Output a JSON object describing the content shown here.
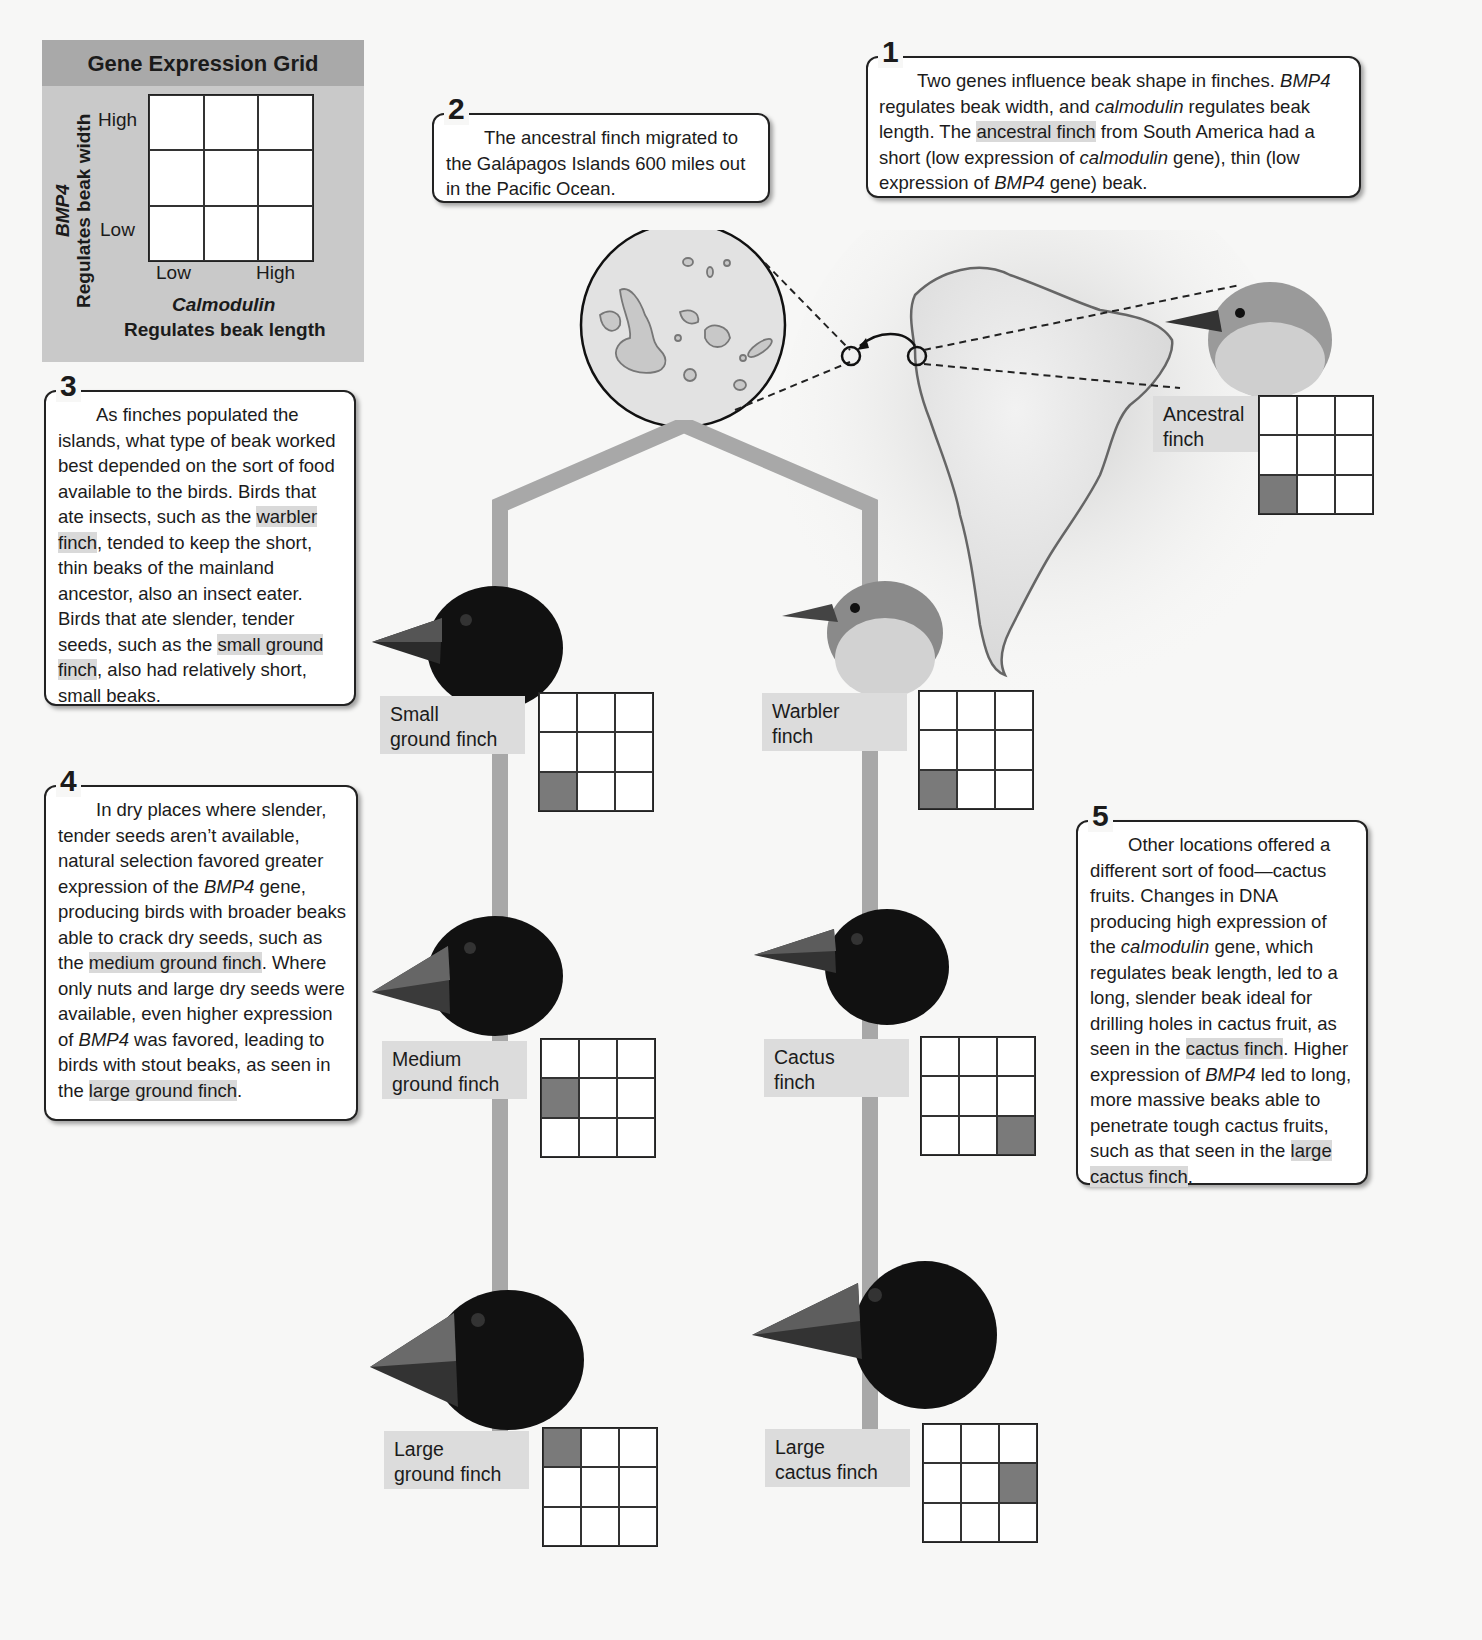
{
  "legend": {
    "title": "Gene Expression Grid",
    "y_gene": "BMP4",
    "y_desc": "Regulates beak width",
    "y_high": "High",
    "y_low": "Low",
    "x_low": "Low",
    "x_high": "High",
    "x_gene": "Calmodulin",
    "x_desc": "Regulates beak length"
  },
  "callouts": [
    {
      "num": "1",
      "segments": [
        {
          "t": "Two genes influence beak shape in finches. "
        },
        {
          "t": "BMP4",
          "i": true
        },
        {
          "t": " regulates beak width, and "
        },
        {
          "t": "calmodulin",
          "i": true
        },
        {
          "t": " regulates beak length. The "
        },
        {
          "t": "ancestral finch",
          "h": true
        },
        {
          "t": " from South America had a short (low expression of "
        },
        {
          "t": "calmodulin",
          "i": true
        },
        {
          "t": " gene), thin (low expression of "
        },
        {
          "t": "BMP4",
          "i": true
        },
        {
          "t": " gene) beak."
        }
      ]
    },
    {
      "num": "2",
      "segments": [
        {
          "t": "The ancestral finch migrated to the Galápagos Islands 600 miles out in the Pacific Ocean."
        }
      ]
    },
    {
      "num": "3",
      "segments": [
        {
          "t": "As finches populated the islands, what type of beak worked best depended on the sort of food available to the birds. Birds that ate insects, such as the "
        },
        {
          "t": "warbler finch",
          "h": true
        },
        {
          "t": ", tended to keep the short, thin beaks of the mainland ancestor, also an insect eater. Birds that ate slender, tender seeds, such as the "
        },
        {
          "t": "small ground finch",
          "h": true
        },
        {
          "t": ", also had relatively short, small beaks."
        }
      ]
    },
    {
      "num": "4",
      "segments": [
        {
          "t": "In dry places where slender, tender seeds aren’t available, natural selection favored greater expression of the "
        },
        {
          "t": "BMP4",
          "i": true
        },
        {
          "t": " gene, producing birds with broader beaks able to crack dry seeds, such as the "
        },
        {
          "t": "medium ground finch",
          "h": true
        },
        {
          "t": ". Where only nuts and large dry seeds were available, even higher expression of "
        },
        {
          "t": "BMP4",
          "i": true
        },
        {
          "t": " was favored, leading to birds with stout beaks, as seen in the "
        },
        {
          "t": "large ground finch",
          "h": true
        },
        {
          "t": "."
        }
      ]
    },
    {
      "num": "5",
      "segments": [
        {
          "t": "Other locations offered a different sort of food—cactus fruits. Changes in DNA producing high expression of the "
        },
        {
          "t": "calmodulin",
          "i": true
        },
        {
          "t": " gene, which regulates beak length, led to a long, slender beak ideal for drilling holes in cactus fruit, as seen in the "
        },
        {
          "t": "cactus finch",
          "h": true
        },
        {
          "t": ". Higher expression of "
        },
        {
          "t": "BMP4",
          "i": true
        },
        {
          "t": " led to long, more massive beaks able to penetrate tough cactus fruits, such as that seen in the "
        },
        {
          "t": "large cactus finch",
          "h": true
        },
        {
          "t": "."
        }
      ]
    }
  ],
  "species": [
    {
      "id": "ancestral",
      "line1": "Ancestral",
      "line2": "finch",
      "calmodulin": "low",
      "bmp4": "low",
      "filled_cell": [
        2,
        0
      ]
    },
    {
      "id": "small-ground",
      "line1": "Small",
      "line2": "ground finch",
      "calmodulin": "low",
      "bmp4": "low",
      "filled_cell": [
        2,
        0
      ]
    },
    {
      "id": "warbler",
      "line1": "Warbler",
      "line2": "finch",
      "calmodulin": "low",
      "bmp4": "low",
      "filled_cell": [
        2,
        0
      ]
    },
    {
      "id": "medium-ground",
      "line1": "Medium",
      "line2": "ground finch",
      "calmodulin": "low",
      "bmp4": "medium",
      "filled_cell": [
        1,
        0
      ]
    },
    {
      "id": "cactus",
      "line1": "Cactus",
      "line2": "finch",
      "calmodulin": "high",
      "bmp4": "low",
      "filled_cell": [
        2,
        2
      ]
    },
    {
      "id": "large-ground",
      "line1": "Large",
      "line2": "ground finch",
      "calmodulin": "low",
      "bmp4": "high",
      "filled_cell": [
        0,
        0
      ]
    },
    {
      "id": "large-cactus",
      "line1": "Large",
      "line2": "cactus finch",
      "calmodulin": "high",
      "bmp4": "medium",
      "filled_cell": [
        1,
        2
      ]
    }
  ],
  "colors": {
    "filled_cell": "#7a7a7a",
    "label_bg": "#dcdcdc",
    "trunk": "#a8a8a8",
    "legend_bg": "#c9c9c9",
    "legend_header": "#a9a9a9"
  }
}
